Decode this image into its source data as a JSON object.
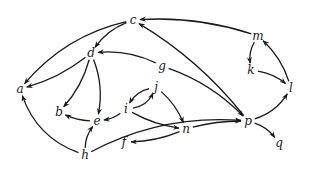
{
  "diagram": {
    "type": "directed-graph",
    "nodes": [
      {
        "id": "a",
        "label": "a"
      },
      {
        "id": "b",
        "label": "b"
      },
      {
        "id": "c",
        "label": "c"
      },
      {
        "id": "d",
        "label": "d"
      },
      {
        "id": "e",
        "label": "e"
      },
      {
        "id": "f",
        "label": "f"
      },
      {
        "id": "g",
        "label": "g"
      },
      {
        "id": "h",
        "label": "h"
      },
      {
        "id": "i",
        "label": "i"
      },
      {
        "id": "j",
        "label": "j"
      },
      {
        "id": "k",
        "label": "k"
      },
      {
        "id": "l",
        "label": "l"
      },
      {
        "id": "m",
        "label": "m"
      },
      {
        "id": "n",
        "label": "n"
      },
      {
        "id": "p",
        "label": "p"
      },
      {
        "id": "q",
        "label": "q"
      }
    ],
    "edges": [
      {
        "from": "c",
        "to": "a"
      },
      {
        "from": "c",
        "to": "d"
      },
      {
        "from": "m",
        "to": "c"
      },
      {
        "from": "p",
        "to": "c"
      },
      {
        "from": "m",
        "to": "k"
      },
      {
        "from": "k",
        "to": "l"
      },
      {
        "from": "l",
        "to": "m"
      },
      {
        "from": "p",
        "to": "l"
      },
      {
        "from": "g",
        "to": "d"
      },
      {
        "from": "g",
        "to": "p"
      },
      {
        "from": "d",
        "to": "a"
      },
      {
        "from": "d",
        "to": "b"
      },
      {
        "from": "d",
        "to": "e"
      },
      {
        "from": "e",
        "to": "b"
      },
      {
        "from": "i",
        "to": "e"
      },
      {
        "from": "i",
        "to": "j"
      },
      {
        "from": "j",
        "to": "i"
      },
      {
        "from": "j",
        "to": "n"
      },
      {
        "from": "i",
        "to": "n"
      },
      {
        "from": "n",
        "to": "f"
      },
      {
        "from": "n",
        "to": "p"
      },
      {
        "from": "h",
        "to": "e"
      },
      {
        "from": "h",
        "to": "a"
      },
      {
        "from": "h",
        "to": "p"
      },
      {
        "from": "p",
        "to": "q"
      }
    ]
  }
}
